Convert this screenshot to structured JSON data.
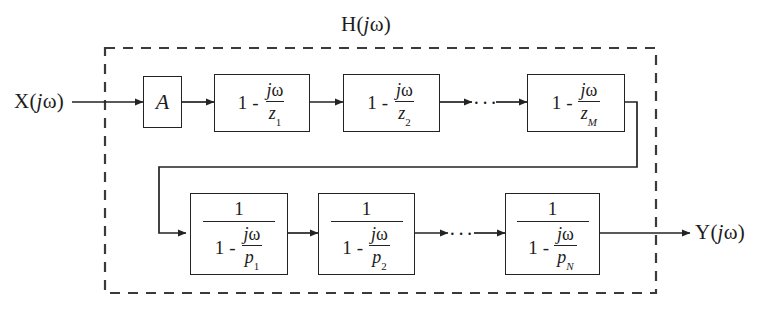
{
  "diagram": {
    "title": "H(jω)",
    "title_parts": {
      "fn": "H",
      "open": "(",
      "imag": "j",
      "omega": "ω",
      "close": ")"
    },
    "input_label": "X(jω)",
    "input_parts": {
      "fn": "X",
      "open": "(",
      "imag": "j",
      "omega": "ω",
      "close": ")"
    },
    "output_label": "Y(jω)",
    "output_parts": {
      "fn": "Y",
      "open": "(",
      "imag": "j",
      "omega": "ω",
      "close": ")"
    },
    "colors": {
      "background": "#ffffff",
      "line": "#232323",
      "text": "#1c1c1c",
      "dashed_border": "#3a3a3a"
    },
    "boundary": {
      "style": "dashed",
      "label": "H(jω)"
    },
    "ellipsis_glyph": "···",
    "gain_block": {
      "label": "A"
    },
    "zero_blocks": [
      {
        "one": "1",
        "minus": "-",
        "numerator_j": "j",
        "numerator_omega": "ω",
        "denominator": "z",
        "subscript": "1"
      },
      {
        "one": "1",
        "minus": "-",
        "numerator_j": "j",
        "numerator_omega": "ω",
        "denominator": "z",
        "subscript": "2"
      },
      {
        "one": "1",
        "minus": "-",
        "numerator_j": "j",
        "numerator_omega": "ω",
        "denominator": "z",
        "subscript": "M"
      }
    ],
    "pole_blocks": [
      {
        "top": "1",
        "one": "1",
        "minus": "-",
        "numerator_j": "j",
        "numerator_omega": "ω",
        "denominator": "p",
        "subscript": "1"
      },
      {
        "top": "1",
        "one": "1",
        "minus": "-",
        "numerator_j": "j",
        "numerator_omega": "ω",
        "denominator": "p",
        "subscript": "2"
      },
      {
        "top": "1",
        "one": "1",
        "minus": "-",
        "numerator_j": "j",
        "numerator_omega": "ω",
        "denominator": "p",
        "subscript": "N"
      }
    ],
    "ellipses": [
      {
        "row": "zeros",
        "text": "···"
      },
      {
        "row": "poles",
        "text": "···"
      }
    ]
  }
}
